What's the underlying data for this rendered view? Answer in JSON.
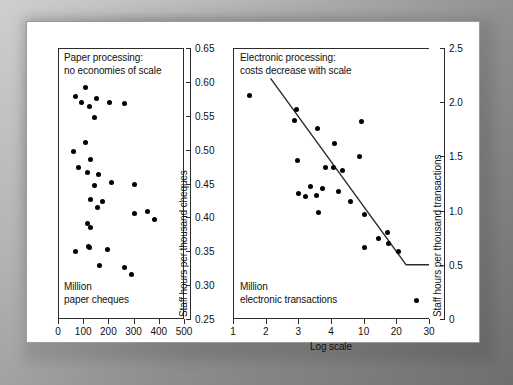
{
  "figure": {
    "background_color": "#ffffff",
    "frame_color": "#9a9a9a",
    "dot_color": "#000000",
    "line_color": "#2b2b2b"
  },
  "chart_data": [
    {
      "type": "scatter",
      "id": "paper-processing",
      "title": "Paper processing:\nno economies of scale",
      "corner_note": "Million\npaper cheques",
      "xlabel": "",
      "ylabel": "Staff hours per thousand cheques",
      "xlim": [
        0,
        500
      ],
      "ylim": [
        0.25,
        0.65
      ],
      "xticks": [
        0,
        100,
        200,
        300,
        400,
        500
      ],
      "xticklabels": [
        "0",
        "100",
        "200",
        "300",
        "400",
        "500"
      ],
      "yticks": [
        0.25,
        0.3,
        0.35,
        0.4,
        0.45,
        0.5,
        0.55,
        0.6,
        0.65
      ],
      "yticklabels": [
        "0.25",
        "0.30",
        "0.35",
        "0.40",
        "0.45",
        "0.50",
        "0.55",
        "0.60",
        "0.65"
      ],
      "grid": false,
      "legend": null,
      "trendline": null,
      "points": [
        {
          "x": 108,
          "y": 0.592
        },
        {
          "x": 68,
          "y": 0.578
        },
        {
          "x": 152,
          "y": 0.575
        },
        {
          "x": 94,
          "y": 0.57
        },
        {
          "x": 126,
          "y": 0.563
        },
        {
          "x": 203,
          "y": 0.569
        },
        {
          "x": 262,
          "y": 0.568
        },
        {
          "x": 145,
          "y": 0.548
        },
        {
          "x": 110,
          "y": 0.51
        },
        {
          "x": 62,
          "y": 0.497
        },
        {
          "x": 128,
          "y": 0.486
        },
        {
          "x": 82,
          "y": 0.473
        },
        {
          "x": 116,
          "y": 0.466
        },
        {
          "x": 160,
          "y": 0.463
        },
        {
          "x": 143,
          "y": 0.447
        },
        {
          "x": 214,
          "y": 0.452
        },
        {
          "x": 302,
          "y": 0.449
        },
        {
          "x": 130,
          "y": 0.426
        },
        {
          "x": 175,
          "y": 0.424
        },
        {
          "x": 156,
          "y": 0.414
        },
        {
          "x": 302,
          "y": 0.405
        },
        {
          "x": 355,
          "y": 0.408
        },
        {
          "x": 382,
          "y": 0.397
        },
        {
          "x": 116,
          "y": 0.391
        },
        {
          "x": 130,
          "y": 0.385
        },
        {
          "x": 120,
          "y": 0.357
        },
        {
          "x": 126,
          "y": 0.355
        },
        {
          "x": 68,
          "y": 0.349
        },
        {
          "x": 196,
          "y": 0.352
        },
        {
          "x": 163,
          "y": 0.329
        },
        {
          "x": 264,
          "y": 0.326
        },
        {
          "x": 292,
          "y": 0.316
        }
      ]
    },
    {
      "type": "scatter",
      "id": "electronic-processing",
      "title": "Electronic processing:\ncosts decrease with scale",
      "corner_note": "Million\nelectronic transactions",
      "xlabel": "Log scale",
      "ylabel": "Staff hours per thousand transactions",
      "x_is_log_categorical": true,
      "xtick_positions": [
        0,
        1,
        2,
        3,
        4,
        5,
        6
      ],
      "xticklabels": [
        "1",
        "2",
        "3",
        "4",
        "10",
        "20",
        "30"
      ],
      "ylim": [
        0,
        2.5
      ],
      "yticks": [
        0,
        0.5,
        1.0,
        1.5,
        2.0,
        2.5
      ],
      "yticklabels": [
        "0",
        "0.5",
        "1.0",
        "1.5",
        "2.0",
        "2.5"
      ],
      "grid": false,
      "legend": null,
      "trendline": {
        "description": "declining straight line flattening to a floor at 0.5",
        "vertices": [
          {
            "x": 1.15,
            "y": 2.22
          },
          {
            "x": 5.3,
            "y": 0.5
          },
          {
            "x": 6.0,
            "y": 0.5
          }
        ]
      },
      "points": [
        {
          "x": 0.52,
          "y": 2.06
        },
        {
          "x": 1.95,
          "y": 1.93
        },
        {
          "x": 1.88,
          "y": 1.83
        },
        {
          "x": 2.58,
          "y": 1.76
        },
        {
          "x": 3.92,
          "y": 1.82
        },
        {
          "x": 3.1,
          "y": 1.62
        },
        {
          "x": 3.88,
          "y": 1.5
        },
        {
          "x": 1.96,
          "y": 1.46
        },
        {
          "x": 2.83,
          "y": 1.4
        },
        {
          "x": 3.07,
          "y": 1.4
        },
        {
          "x": 3.36,
          "y": 1.37
        },
        {
          "x": 2.36,
          "y": 1.22
        },
        {
          "x": 2.73,
          "y": 1.2
        },
        {
          "x": 1.99,
          "y": 1.16
        },
        {
          "x": 3.24,
          "y": 1.18
        },
        {
          "x": 2.23,
          "y": 1.13
        },
        {
          "x": 2.57,
          "y": 1.14
        },
        {
          "x": 3.6,
          "y": 1.08
        },
        {
          "x": 2.61,
          "y": 0.98
        },
        {
          "x": 4.02,
          "y": 0.96
        },
        {
          "x": 4.72,
          "y": 0.8
        },
        {
          "x": 4.45,
          "y": 0.74
        },
        {
          "x": 4.77,
          "y": 0.7
        },
        {
          "x": 4.04,
          "y": 0.66
        },
        {
          "x": 5.06,
          "y": 0.62
        },
        {
          "x": 5.62,
          "y": 0.17
        }
      ]
    }
  ]
}
